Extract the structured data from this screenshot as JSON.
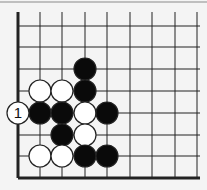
{
  "board": {
    "columns_x": [
      18,
      40,
      62,
      85,
      107,
      130,
      152,
      175,
      197
    ],
    "rows_y": [
      26,
      47,
      69,
      91,
      113,
      135,
      156,
      178
    ],
    "top_border_y": 2,
    "stone_radius": 11,
    "colors": {
      "background": "#f4f4f4",
      "line": "#222222",
      "black": "#0a0a0a",
      "white": "#ffffff",
      "border": "#888888"
    }
  },
  "stones": [
    {
      "color": "black",
      "col": 3,
      "row": 2
    },
    {
      "color": "black",
      "col": 3,
      "row": 3
    },
    {
      "color": "white",
      "col": 1,
      "row": 3
    },
    {
      "color": "white",
      "col": 2,
      "row": 3
    },
    {
      "color": "black",
      "col": 1,
      "row": 4
    },
    {
      "color": "black",
      "col": 2,
      "row": 4
    },
    {
      "color": "white",
      "col": 3,
      "row": 4
    },
    {
      "color": "black",
      "col": 4,
      "row": 4
    },
    {
      "color": "black",
      "col": 2,
      "row": 5
    },
    {
      "color": "white",
      "col": 3,
      "row": 5
    },
    {
      "color": "white",
      "col": 1,
      "row": 6
    },
    {
      "color": "white",
      "col": 2,
      "row": 6
    },
    {
      "color": "black",
      "col": 3,
      "row": 6
    },
    {
      "color": "black",
      "col": 4,
      "row": 6
    }
  ],
  "move_marker": {
    "label": "1",
    "color": "white",
    "col": 0,
    "row": 4
  }
}
